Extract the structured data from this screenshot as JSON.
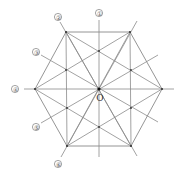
{
  "figure": {
    "center_label": "O",
    "axis_labels": [
      "①",
      "②",
      "③",
      "④",
      "⑤",
      "⑥"
    ],
    "colors": {
      "lines": "#8a8a8a",
      "points": "#333333",
      "labels": "#555555",
      "background": "#ffffff"
    }
  }
}
